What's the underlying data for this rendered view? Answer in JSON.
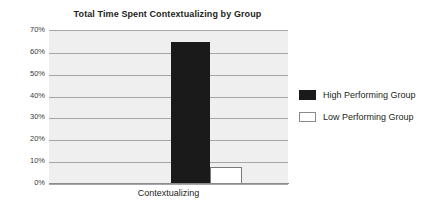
{
  "chart_data": {
    "type": "bar",
    "title": "Total Time Spent Contextualizing by Group",
    "xlabel": "",
    "ylabel": "",
    "categories": [
      "Contextualizing"
    ],
    "series": [
      {
        "name": "High Performing Group",
        "values": [
          65
        ],
        "color": "#1a1a1a"
      },
      {
        "name": "Low Performing Group",
        "values": [
          8
        ],
        "color": "#ffffff"
      }
    ],
    "ylim": [
      0,
      70
    ],
    "y_ticks": [
      70,
      60,
      50,
      40,
      30,
      20,
      10,
      0
    ],
    "y_tick_labels": [
      "70%",
      "60%",
      "50%",
      "40%",
      "30%",
      "20%",
      "10%",
      "0%"
    ],
    "grid": true,
    "legend_position": "right",
    "plot_background": "#efefef",
    "gridline_color": "#a6a6a6"
  },
  "legend": {
    "items": [
      {
        "label": "High Performing Group",
        "swatch": "filled-black-swatch"
      },
      {
        "label": "Low Performing Group",
        "swatch": "outlined-white-swatch"
      }
    ]
  },
  "axis": {
    "category_label": "Contextualizing",
    "ticks": [
      "70%",
      "60%",
      "50%",
      "40%",
      "30%",
      "20%",
      "10%",
      "0%"
    ]
  }
}
